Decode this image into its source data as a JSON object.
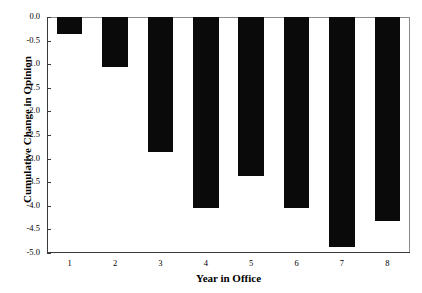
{
  "chart_data": {
    "type": "bar",
    "title": "",
    "xlabel": "Year in Office",
    "ylabel": "Cumulative Change in Opinion",
    "categories": [
      "1",
      "2",
      "3",
      "4",
      "5",
      "6",
      "7",
      "8"
    ],
    "values": [
      -0.35,
      -1.05,
      -2.86,
      -4.05,
      -3.37,
      -4.05,
      -4.88,
      -4.33
    ],
    "xlim": [
      0.5,
      8.5
    ],
    "ylim": [
      -5.0,
      0.0
    ],
    "yticks": [
      0.0,
      -0.5,
      -1.0,
      -1.5,
      -2.0,
      -2.5,
      -3.0,
      -3.5,
      -4.0,
      -4.5,
      -5.0
    ],
    "ytick_labels": [
      "0.0",
      "-0.5",
      "-1.0",
      "-1.5",
      "-2.0",
      "-2.5",
      "-3.0",
      "-3.5",
      "-4.0",
      "-4.5",
      "-5.0"
    ],
    "xtick_labels": [
      "1",
      "2",
      "3",
      "4",
      "5",
      "6",
      "7",
      "8"
    ],
    "grid": false,
    "legend": null,
    "bar_color": "#0a0a0a",
    "frame_color": "#8a8a8a",
    "axis_color": "#3a3a3a",
    "background": "#ffffff"
  }
}
